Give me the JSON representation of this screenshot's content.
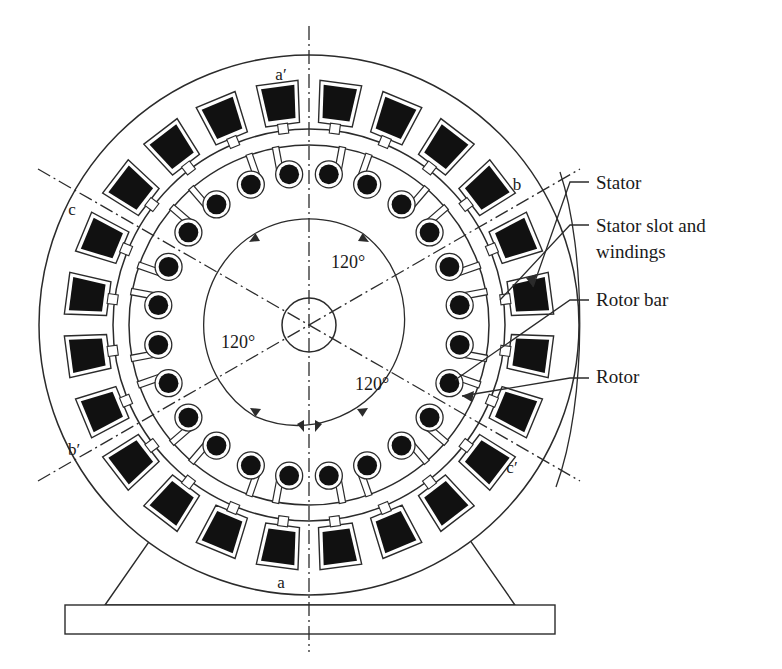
{
  "figure": {
    "type": "engineering-cross-section-diagram"
  },
  "colors": {
    "line": "#2b2b2b",
    "fill_slot": "#111111",
    "background": "#ffffff",
    "text": "#1a1a1a"
  },
  "geometry": {
    "center_x": 309,
    "center_y": 325,
    "stator_outer_radius": 270,
    "stator_bore_radius": 196,
    "rotor_outer_radius": 180,
    "rotor_inner_radius": 152,
    "shaft_radius": 27,
    "angle_circle_radius": 107,
    "stator_slot_count": 24,
    "rotor_bar_count": 24
  },
  "axis_labels": [
    {
      "id": "a-prime",
      "text": "a′",
      "x": 281,
      "y": 80
    },
    {
      "id": "b",
      "text": "b",
      "x": 517,
      "y": 190
    },
    {
      "id": "c-prime",
      "text": "c′",
      "x": 512,
      "y": 473
    },
    {
      "id": "a",
      "text": "a",
      "x": 281,
      "y": 588
    },
    {
      "id": "b-prime",
      "text": "b′",
      "x": 74,
      "y": 455
    },
    {
      "id": "c",
      "text": "c",
      "x": 72,
      "y": 215
    }
  ],
  "angle_labels": [
    {
      "id": "angle-top",
      "text": "120°",
      "x": 331,
      "y": 268
    },
    {
      "id": "angle-left",
      "text": "120°",
      "x": 221,
      "y": 348
    },
    {
      "id": "angle-bottom",
      "text": "120°",
      "x": 355,
      "y": 390
    }
  ],
  "callouts": [
    {
      "id": "stator",
      "text": "Stator",
      "x": 596,
      "y": 189,
      "line2": ""
    },
    {
      "id": "stator-slot-and-windings",
      "text": "Stator slot and",
      "line2": "windings",
      "x": 596,
      "y": 232
    },
    {
      "id": "rotor-bar",
      "text": "Rotor bar",
      "x": 596,
      "y": 306,
      "line2": ""
    },
    {
      "id": "rotor",
      "text": "Rotor",
      "x": 596,
      "y": 383,
      "line2": ""
    }
  ],
  "base": {
    "pedestal": "trapezoid support",
    "foot": "rectangular base plate"
  }
}
